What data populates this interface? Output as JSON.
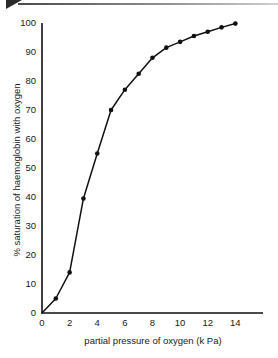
{
  "banner": {
    "wedge_icon": "triangle-wedge-icon",
    "rule_color": "#8f8f8f"
  },
  "chart_data": {
    "type": "line",
    "title": "",
    "subtitle": "",
    "xlabel": "partial pressure of oxygen (k Pa)",
    "ylabel": "% saturation of haemoglobin with oxygen",
    "xlim": [
      0,
      16
    ],
    "ylim": [
      0,
      100
    ],
    "xticks": [
      0,
      2,
      4,
      6,
      8,
      10,
      12,
      14
    ],
    "xtick_labels": [
      "0",
      "2",
      "4",
      "6",
      "8",
      "10",
      "12",
      "14"
    ],
    "yticks": [
      0,
      10,
      20,
      30,
      40,
      50,
      60,
      70,
      80,
      90,
      100
    ],
    "ytick_labels": [
      "0",
      "10",
      "20",
      "30",
      "40",
      "50",
      "60",
      "70",
      "80",
      "90",
      "100"
    ],
    "grid": false,
    "legend": false,
    "legend_position": "none",
    "marker": "filled-circle",
    "line_color": "#111111",
    "marker_color": "#111111",
    "series": [
      {
        "name": "oxygen dissociation curve",
        "x": [
          0,
          1,
          2,
          3,
          4,
          5,
          6,
          7,
          8,
          9,
          10,
          11,
          12,
          13,
          14
        ],
        "values": [
          0,
          5,
          14,
          39.5,
          55,
          70,
          77,
          82.5,
          88,
          91.5,
          93.5,
          95.5,
          97,
          98.5,
          99.8
        ]
      }
    ]
  }
}
